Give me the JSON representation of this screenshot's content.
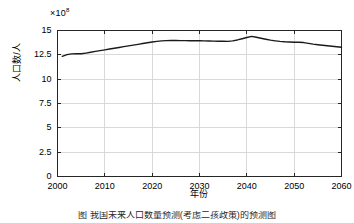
{
  "chart_data": {
    "type": "line",
    "title": "",
    "xlabel": "年份",
    "ylabel": "人口数/人",
    "exponent_label": "×10",
    "exponent_value": "8",
    "multiplier": 100000000,
    "xlim": [
      2000,
      2060
    ],
    "ylim": [
      0,
      15
    ],
    "xticks": [
      2000,
      2010,
      2020,
      2030,
      2040,
      2050,
      2060
    ],
    "xtick_labels": [
      "2000",
      "2010",
      "2020",
      "2030",
      "2040",
      "2050",
      "2060"
    ],
    "yticks": [
      0,
      2.5,
      5,
      7.5,
      10,
      12.5,
      15
    ],
    "ytick_labels": [
      "0",
      "2.5",
      "5",
      "7.5",
      "10",
      "12.5",
      "15"
    ],
    "grid": true,
    "legend": "none",
    "line_color": "#1a1a1a",
    "line_width": 1.4,
    "x": [
      2001,
      2002,
      2003,
      2004,
      2005,
      2006,
      2007,
      2008,
      2009,
      2010,
      2011,
      2012,
      2013,
      2014,
      2015,
      2016,
      2017,
      2018,
      2019,
      2020,
      2021,
      2022,
      2023,
      2024,
      2025,
      2026,
      2027,
      2028,
      2029,
      2030,
      2031,
      2032,
      2033,
      2034,
      2035,
      2036,
      2037,
      2038,
      2039,
      2040,
      2041,
      2042,
      2043,
      2044,
      2045,
      2046,
      2047,
      2048,
      2049,
      2050,
      2051,
      2052,
      2053,
      2054,
      2055,
      2056,
      2057,
      2058,
      2059,
      2060
    ],
    "y": [
      12.35,
      12.52,
      12.6,
      12.61,
      12.61,
      12.68,
      12.76,
      12.85,
      12.93,
      13.01,
      13.1,
      13.18,
      13.26,
      13.34,
      13.42,
      13.5,
      13.58,
      13.66,
      13.74,
      13.82,
      13.88,
      13.93,
      13.96,
      13.97,
      13.97,
      13.96,
      13.96,
      13.95,
      13.95,
      13.94,
      13.93,
      13.92,
      13.91,
      13.9,
      13.89,
      13.88,
      13.93,
      14.03,
      14.15,
      14.28,
      14.4,
      14.31,
      14.2,
      14.1,
      14.01,
      13.94,
      13.88,
      13.84,
      13.82,
      13.8,
      13.8,
      13.76,
      13.68,
      13.6,
      13.54,
      13.49,
      13.43,
      13.38,
      13.33,
      13.28
    ],
    "ylabel_unit": "人",
    "axis_color": "#262626",
    "grid_color": "#d9d9d9"
  },
  "figure": {
    "caption": "图     我国未来人口数量预测(考虑二孩政策)的预测图"
  }
}
